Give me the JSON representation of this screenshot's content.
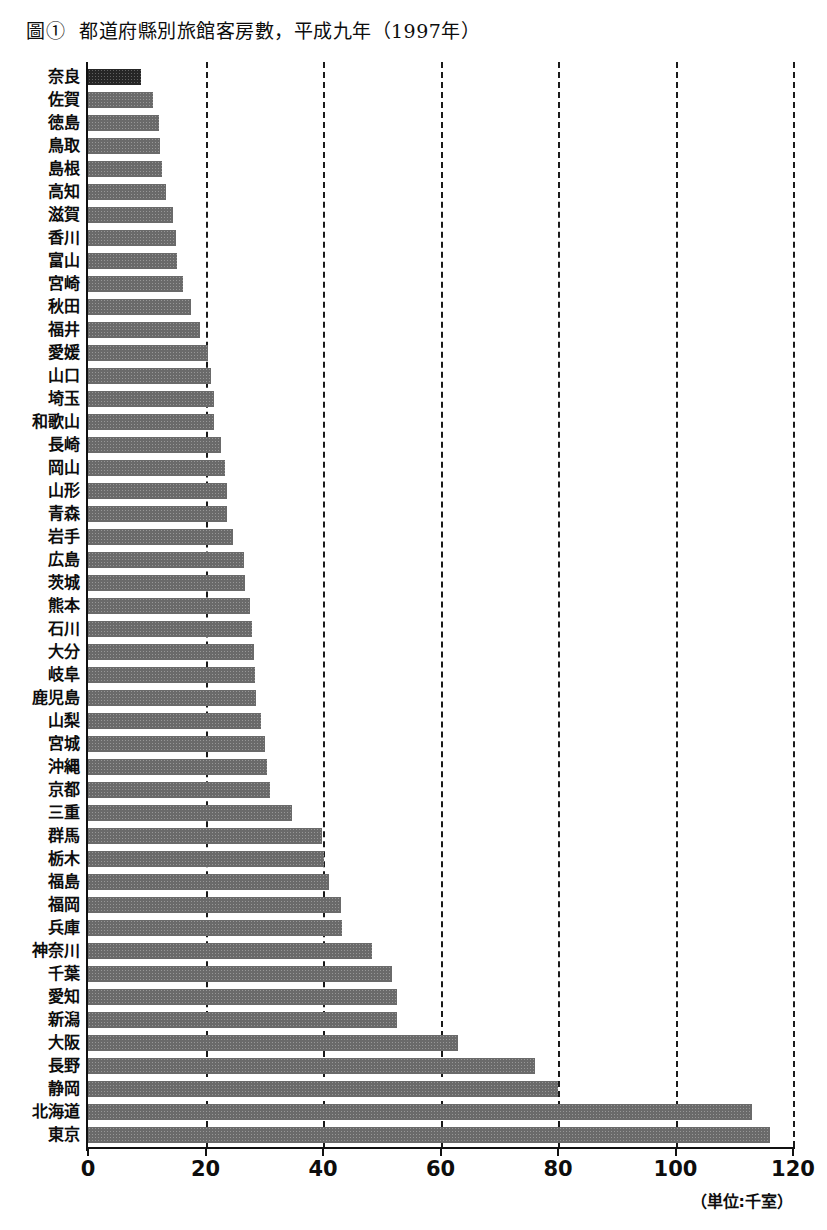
{
  "figure": {
    "number": "圖①",
    "title": "都道府縣別旅館客房數，平成九年（1997年）"
  },
  "axis": {
    "unit_label": "（単位:千室）",
    "tick_labels": [
      "0",
      "20",
      "40",
      "60",
      "80",
      "100",
      "120"
    ]
  },
  "colors": {
    "bar": "#6a6a6a",
    "bar_highlight": "#262626",
    "axis": "#111111",
    "gridline": "#1a1a1a",
    "background": "#ffffff"
  },
  "chart_data": {
    "type": "bar",
    "orientation": "horizontal",
    "xlabel": "（単位:千室）",
    "ylabel": "",
    "xlim": [
      0,
      120
    ],
    "xticks": [
      0,
      20,
      40,
      60,
      80,
      100,
      120
    ],
    "grid": "vertical-dashed",
    "legend": "none",
    "highlight_category": "奈良",
    "categories": [
      "奈良",
      "佐賀",
      "徳島",
      "鳥取",
      "島根",
      "高知",
      "滋賀",
      "香川",
      "富山",
      "宮崎",
      "秋田",
      "福井",
      "愛媛",
      "山口",
      "埼玉",
      "和歌山",
      "長崎",
      "岡山",
      "山形",
      "青森",
      "岩手",
      "広島",
      "茨城",
      "熊本",
      "石川",
      "大分",
      "岐阜",
      "鹿児島",
      "山梨",
      "宮城",
      "沖縄",
      "京都",
      "三重",
      "群馬",
      "栃木",
      "福島",
      "福岡",
      "兵庫",
      "神奈川",
      "千葉",
      "愛知",
      "新潟",
      "大阪",
      "長野",
      "静岡",
      "北海道",
      "東京"
    ],
    "values": [
      9.0,
      11.0,
      12.0,
      12.2,
      12.6,
      13.2,
      14.4,
      15.0,
      15.2,
      16.2,
      17.5,
      19.0,
      20.5,
      21.0,
      21.4,
      21.5,
      22.7,
      23.4,
      23.6,
      23.7,
      24.6,
      26.6,
      26.8,
      27.6,
      27.9,
      28.2,
      28.5,
      28.6,
      29.4,
      30.2,
      30.4,
      31.0,
      34.8,
      39.8,
      40.2,
      41.0,
      43.0,
      43.2,
      48.3,
      51.8,
      52.6,
      52.6,
      63.0,
      76.0,
      80.0,
      113.0,
      116.0
    ],
    "series_name": "旅館客房數"
  }
}
